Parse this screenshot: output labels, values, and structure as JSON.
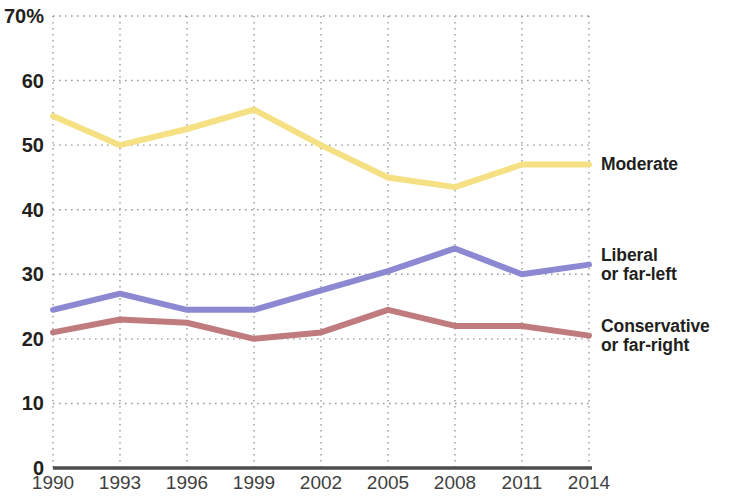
{
  "chart_data": {
    "type": "line",
    "title": "",
    "subtitle": "",
    "xlabel": "",
    "ylabel": "",
    "x": [
      1990,
      1993,
      1996,
      1999,
      2002,
      2005,
      2008,
      2011,
      2014
    ],
    "categories": [
      "1990",
      "1993",
      "1996",
      "1999",
      "2002",
      "2005",
      "2008",
      "2011",
      "2014"
    ],
    "xlim": [
      1990,
      2014
    ],
    "ylim": [
      0,
      70
    ],
    "y_ticks": [
      0,
      10,
      20,
      30,
      40,
      50,
      60,
      70
    ],
    "y_tick_labels": [
      "0",
      "10",
      "20",
      "30",
      "40",
      "50",
      "60",
      "70%"
    ],
    "grid": true,
    "grid_style": "dotted",
    "legend_position": "right-inline-end-of-line",
    "series": [
      {
        "name": "Moderate",
        "label_line1": "Moderate",
        "label_line2": "",
        "color": "#F5E083",
        "values": [
          54.5,
          50,
          52.5,
          55.5,
          50,
          45,
          43.5,
          47,
          47
        ]
      },
      {
        "name": "Liberal or far-left",
        "label_line1": "Liberal",
        "label_line2": "or far-left",
        "color": "#8C89D2",
        "values": [
          24.5,
          27,
          24.5,
          24.5,
          27.5,
          30.5,
          34,
          30,
          31.5
        ]
      },
      {
        "name": "Conservative or far-right",
        "label_line1": "Conservative",
        "label_line2": "or far-right",
        "color": "#BF7B7E",
        "values": [
          21,
          23,
          22.5,
          20,
          21,
          24.5,
          22,
          22,
          20.5
        ]
      }
    ],
    "axis_color": "#4d4d4d",
    "grid_color": "#9a9a9a",
    "background": "#ffffff"
  }
}
